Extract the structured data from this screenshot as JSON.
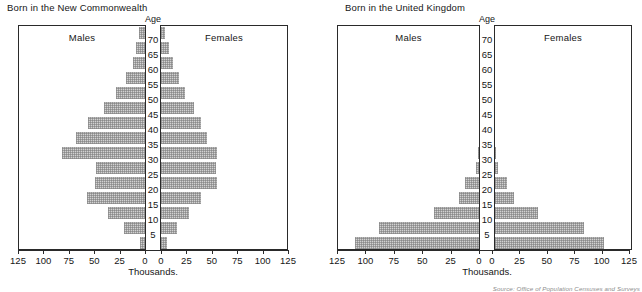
{
  "figure": {
    "source_note": "Source: Office of Population Censuses and Surveys",
    "axis_caption": "Thousands.",
    "age_caption": "Age",
    "males_label": "Males",
    "females_label": "Females",
    "bar_color": "#d2d2d2",
    "frame_color": "#2a2a2a"
  },
  "axis": {
    "tick_labels": [
      "125",
      "100",
      "75",
      "50",
      "25",
      "0",
      "0",
      "25",
      "50",
      "75",
      "100",
      "125"
    ],
    "max": 125,
    "step": 25
  },
  "age_axis": {
    "tick_labels": [
      "70",
      "65",
      "60",
      "55",
      "50",
      "45",
      "40",
      "35",
      "30",
      "25",
      "20",
      "15",
      "10",
      "5"
    ]
  },
  "chart_data": [
    {
      "type": "bar",
      "title": "Born in the New Commonwealth",
      "xlabel": "Thousands.",
      "ylabel": "Age",
      "xlim": [
        0,
        125
      ],
      "grid": false,
      "legend": "none",
      "categories": [
        "0-4",
        "5-9",
        "10-14",
        "15-19",
        "20-24",
        "25-29",
        "30-34",
        "35-39",
        "40-44",
        "45-49",
        "50-54",
        "55-59",
        "60-64",
        "65-69",
        "70+"
      ],
      "series": [
        {
          "name": "Males",
          "values": [
            5,
            21,
            36,
            57,
            49,
            48,
            82,
            68,
            56,
            40,
            29,
            19,
            12,
            9,
            6
          ]
        },
        {
          "name": "Females",
          "values": [
            6,
            16,
            28,
            39,
            55,
            54,
            55,
            45,
            39,
            32,
            24,
            18,
            12,
            8,
            4
          ]
        }
      ]
    },
    {
      "type": "bar",
      "title": "Born in the United Kingdom",
      "xlabel": "Thousands.",
      "ylabel": "Age",
      "xlim": [
        0,
        125
      ],
      "grid": false,
      "legend": "none",
      "categories": [
        "0-4",
        "5-9",
        "10-14",
        "15-19",
        "20-24",
        "25-29",
        "30-34",
        "35-39",
        "40-44",
        "45-49",
        "50-54",
        "55-59",
        "60-64",
        "65-69",
        "70+"
      ],
      "series": [
        {
          "name": "Males",
          "values": [
            109,
            88,
            40,
            18,
            12,
            3,
            1,
            0,
            0,
            0,
            0,
            0,
            0,
            0,
            0
          ]
        },
        {
          "name": "Females",
          "values": [
            99,
            81,
            39,
            17,
            11,
            3,
            1,
            0,
            0,
            0,
            0,
            0,
            0,
            0,
            0
          ]
        }
      ]
    }
  ]
}
